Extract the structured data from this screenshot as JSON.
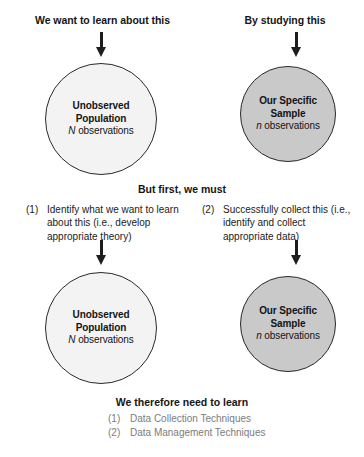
{
  "diagram": {
    "colors": {
      "population_fill": "#f3f3f3",
      "sample_fill": "#c9c9c9",
      "outline": "#2a2a2a",
      "text": "#141414",
      "muted_text": "#7c7c7c"
    },
    "headers": {
      "left": "We want to learn about this",
      "right": "By studying this"
    },
    "arrows": [
      {
        "name": "arrow-to-population-top",
        "direction": "down"
      },
      {
        "name": "arrow-to-sample-top",
        "direction": "down"
      },
      {
        "name": "arrow-to-population-bottom",
        "direction": "down"
      },
      {
        "name": "arrow-to-sample-bottom",
        "direction": "down"
      }
    ],
    "circles": {
      "population": {
        "line1": "Unobserved",
        "line2": "Population",
        "symbol": "N",
        "observations_label": " observations"
      },
      "sample": {
        "line1": "Our Specific",
        "line2": "Sample",
        "symbol": "n",
        "observations_label": " observations"
      }
    },
    "middle": {
      "heading": "But first, we must",
      "steps": [
        {
          "marker": "(1)",
          "text": "Identify what we want to learn about this (i.e., develop appropriate theory)"
        },
        {
          "marker": "(2)",
          "text": "Successfully collect this (i.e., identify and collect appropriate data)"
        }
      ]
    },
    "footer": {
      "heading": "We therefore need to learn",
      "items": [
        {
          "marker": "(1)",
          "text": "Data Collection Techniques"
        },
        {
          "marker": "(2)",
          "text": "Data Management Techniques"
        }
      ]
    }
  }
}
